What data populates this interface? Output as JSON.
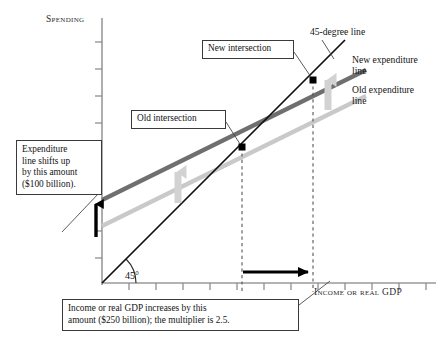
{
  "figure": {
    "type": "economics-expenditure-multiplier-diagram",
    "axes": {
      "y_title": "Spending",
      "x_title": "Income or real GDP",
      "y_axis_x_px": 102,
      "y_axis_top_px": 18,
      "x_axis_y_px": 283,
      "x_axis_right_px": 436,
      "origin": {
        "x": 102,
        "y": 283
      },
      "grid": false,
      "tick_labels_y": [],
      "tick_labels_x": [],
      "y_tick_spacing_px": 27,
      "x_tick_spacing_px": 27
    },
    "colors": {
      "forty_five_line": "#111111",
      "new_expenditure_line": "#6f6f6f",
      "old_expenditure_line": "#c9c9c9",
      "shift_arrow": "#000000",
      "gap_arrow": "#000000",
      "shift_hint_arrow": "#d2d2d2",
      "callout_border": "#3a3a3a",
      "dashed_guide": "#555555",
      "text": "#141414"
    },
    "lines": [
      {
        "name": "45-degree line",
        "label": "45-degree line",
        "style": "solid",
        "color": "#111111",
        "from": {
          "x": 102,
          "y": 283
        },
        "to": {
          "x": 345,
          "y": 44
        }
      },
      {
        "name": "new expenditure line",
        "label": "New expenditure\nline",
        "style": "solid",
        "color": "#6f6f6f",
        "from": {
          "x": 102,
          "y": 200
        },
        "to": {
          "x": 366,
          "y": 70
        }
      },
      {
        "name": "old expenditure line",
        "label": "Old expenditure\nline",
        "style": "solid",
        "color": "#c9c9c9",
        "from": {
          "x": 102,
          "y": 226
        },
        "to": {
          "x": 366,
          "y": 96
        }
      }
    ],
    "points": [
      {
        "name": "old intersection",
        "x": 242,
        "y": 147
      },
      {
        "name": "new intersection",
        "x": 313,
        "y": 80
      }
    ],
    "guides": [
      {
        "name": "old-intersection-dashed-drop",
        "x": 242,
        "y_from": 147,
        "y_to": 290
      },
      {
        "name": "new-intersection-dashed-drop",
        "x": 313,
        "y_from": 80,
        "y_to": 290
      }
    ],
    "arrows": {
      "vertical_shift": {
        "x": 96,
        "y_from": 236,
        "y_to": 199
      },
      "horizontal_gap": {
        "y": 272,
        "x_from": 243,
        "x_to": 315
      },
      "hint_left": {
        "x": 178,
        "y_from": 200,
        "y_to": 166
      },
      "hint_right": {
        "x": 328,
        "y_from": 108,
        "y_to": 74
      }
    },
    "angle_marker": {
      "label": "45°",
      "vertex": {
        "x": 102,
        "y": 283
      },
      "radius": 34
    }
  },
  "callouts": {
    "expenditure_shift": "Expenditure\nline shifts up\nby this amount\n($100 billion).",
    "old_intersection": "Old intersection",
    "new_intersection": "New intersection",
    "gdp_increase": "Income or real GDP increases by this\namount ($250 billion); the multiplier is 2.5."
  },
  "labels": {
    "forty_five_degree_line": "45-degree line",
    "new_expenditure_line": "New expenditure\nline",
    "old_expenditure_line": "Old expenditure\nline",
    "angle": "45°",
    "y_axis_title": "Spending",
    "x_axis_title": "Income or real GDP"
  }
}
